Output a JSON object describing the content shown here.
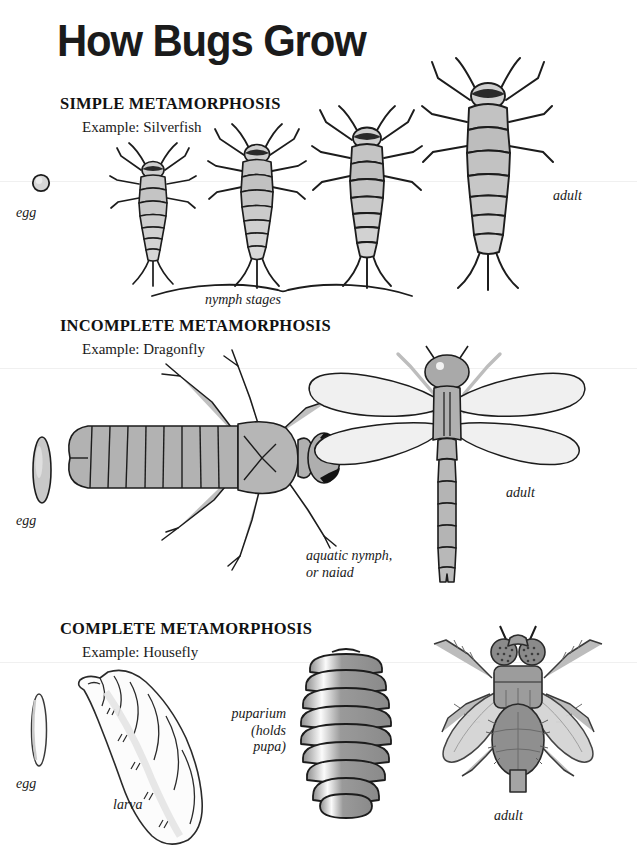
{
  "page": {
    "title": "How Bugs Grow",
    "background": "#ffffff",
    "ink": "#1a1a1a"
  },
  "sections": [
    {
      "id": "simple",
      "heading": "SIMPLE METAMORPHOSIS",
      "example": "Example: Silverfish",
      "labels": {
        "egg": "egg",
        "bracket": "nymph stages",
        "adult": "adult"
      },
      "stages": [
        "egg",
        "nymph 1",
        "nymph 2",
        "nymph 3",
        "adult"
      ]
    },
    {
      "id": "incomplete",
      "heading": "INCOMPLETE METAMORPHOSIS",
      "example": "Example: Dragonfly",
      "labels": {
        "egg": "egg",
        "nymph": "aquatic nymph,\nor naiad",
        "adult": "adult"
      },
      "stages": [
        "egg",
        "aquatic nymph",
        "adult"
      ]
    },
    {
      "id": "complete",
      "heading": "COMPLETE METAMORPHOSIS",
      "example": "Example: Housefly",
      "labels": {
        "egg": "egg",
        "larva": "larva",
        "pupa": "puparium\n(holds\npupa)",
        "adult": "adult"
      },
      "stages": [
        "egg",
        "larva",
        "puparium",
        "adult"
      ]
    }
  ],
  "palette": {
    "body_fill": "#b9b9b9",
    "body_fill_light": "#cfcfcf",
    "body_fill_lighter": "#dcdcdc",
    "wing_fill": "#efefef",
    "outline": "#1c1c1c",
    "dark": "#111111"
  }
}
